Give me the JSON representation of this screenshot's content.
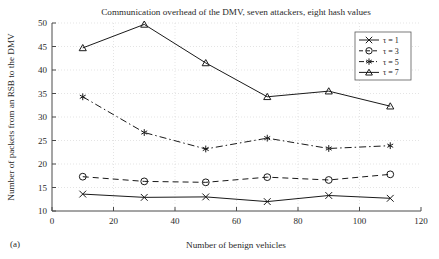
{
  "figure": {
    "caption": "(a)",
    "background": "#ffffff",
    "ink_color": "#1a1a1a"
  },
  "chart_data": {
    "type": "line",
    "title": "Communication overhead of the DMV, seven attackers, eight hash values",
    "xlabel": "Number of benign vehicles",
    "ylabel": "Number of packets from an RSB to the DMV",
    "x": [
      10,
      30,
      50,
      70,
      90,
      110
    ],
    "xlim": [
      0,
      120
    ],
    "ylim": [
      10,
      50
    ],
    "xticks": [
      0,
      20,
      40,
      60,
      80,
      100,
      120
    ],
    "yticks": [
      10,
      15,
      20,
      25,
      30,
      35,
      40,
      45,
      50
    ],
    "xtick_labels": [
      "0",
      "20",
      "40",
      "60",
      "80",
      "100",
      "120"
    ],
    "ytick_labels": [
      "10",
      "15",
      "20",
      "25",
      "30",
      "35",
      "40",
      "45",
      "50"
    ],
    "grid": true,
    "legend_position": "upper right",
    "series": [
      {
        "name": "τ = 1",
        "marker": "x-cross",
        "linestyle": "solid",
        "values": [
          13.6,
          12.9,
          13.0,
          12.0,
          13.3,
          12.7
        ]
      },
      {
        "name": "τ = 3",
        "marker": "circle",
        "linestyle": "dashed",
        "values": [
          17.3,
          16.3,
          16.1,
          17.2,
          16.6,
          17.8
        ]
      },
      {
        "name": "τ = 5",
        "marker": "asterisk",
        "linestyle": "dashdot",
        "values": [
          34.3,
          26.7,
          23.2,
          25.5,
          23.3,
          23.9
        ]
      },
      {
        "name": "τ = 7",
        "marker": "triangle",
        "linestyle": "solid",
        "values": [
          44.7,
          49.7,
          41.5,
          34.3,
          35.5,
          32.3
        ]
      }
    ]
  }
}
